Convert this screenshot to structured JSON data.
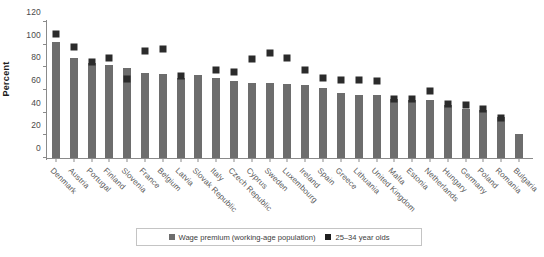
{
  "chart_data": {
    "type": "bar",
    "title": "",
    "subtitle": "",
    "xlabel": "",
    "ylabel": "Percent",
    "ylim": [
      0,
      120
    ],
    "yticks": [
      0,
      20,
      40,
      60,
      80,
      100,
      120
    ],
    "grid": false,
    "legend_position": "bottom",
    "categories": [
      "Denmark",
      "Austria",
      "Portugal",
      "Finland",
      "Slovenia",
      "France",
      "Belgium",
      "Latvia",
      "Slovak Republic",
      "Italy",
      "Czech Republic",
      "Cyprus",
      "Sweden",
      "Luxembourg",
      "Ireland",
      "Spain",
      "Greece",
      "Lithuania",
      "United Kingdom",
      "Malta",
      "Estonia",
      "Netherlands",
      "Hungary",
      "Germany",
      "Poland",
      "Romania",
      "Bulgaria"
    ],
    "series": [
      {
        "name": "Wage premium (working-age population)",
        "type": "bar",
        "color": "#6d6d6d",
        "values": [
          102,
          88,
          84,
          82,
          79,
          75,
          74,
          71,
          73,
          71,
          68,
          66,
          66,
          65,
          64,
          62,
          57,
          56,
          56,
          52,
          51,
          51,
          47,
          43,
          42,
          36,
          21
        ]
      },
      {
        "name": "25–34 year olds",
        "type": "marker",
        "color": "#2b2b2b",
        "values": [
          109,
          98,
          85,
          88,
          70,
          94,
          96,
          72,
          null,
          78,
          76,
          87,
          93,
          88,
          78,
          71,
          69,
          69,
          68,
          52,
          52,
          59,
          48,
          47,
          43,
          35,
          null
        ]
      }
    ],
    "legend": [
      {
        "label": "Wage premium (working-age population)",
        "swatch": "#6d6d6d"
      },
      {
        "label": "25–34 year olds",
        "swatch": "#1f1f1f"
      }
    ]
  }
}
